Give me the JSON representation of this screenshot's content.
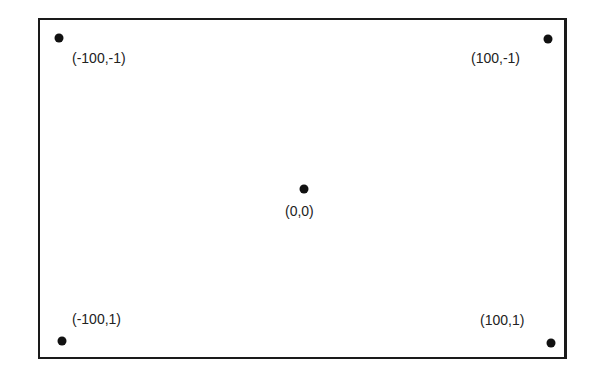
{
  "diagram": {
    "colors": {
      "ink": "#1a1a1a",
      "background": "#ffffff"
    },
    "points": [
      {
        "id": "top-left",
        "label": "(-100,-1)",
        "dot": [
          59,
          38
        ],
        "text": [
          72,
          52
        ]
      },
      {
        "id": "top-right",
        "label": "(100,-1)",
        "dot": [
          548,
          39
        ],
        "text": [
          471,
          52
        ]
      },
      {
        "id": "center",
        "label": "(0,0)",
        "dot": [
          304,
          189
        ],
        "text": [
          285,
          205
        ]
      },
      {
        "id": "bottom-left",
        "label": "(-100,1)",
        "dot": [
          62,
          341
        ],
        "text": [
          72,
          313
        ]
      },
      {
        "id": "bottom-right",
        "label": "(100,1)",
        "dot": [
          551,
          343
        ],
        "text": [
          480,
          314
        ]
      }
    ]
  }
}
